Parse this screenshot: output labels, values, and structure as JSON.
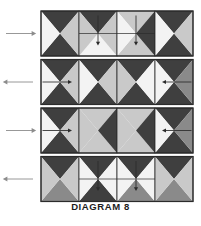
{
  "caption": {
    "text": "DIAGRAM 8"
  },
  "colors": {
    "dark": "#3f3f3f",
    "mid": "#8a8a8a",
    "light": "#c9c9c9",
    "white": "#f3f3f3",
    "outline": "#2b2b2b",
    "arrow": "#2b2b2b",
    "margin_arrow": "#8c8c8c",
    "background": "#ffffff"
  },
  "figure": {
    "label": "folded-paper-strip-diagram",
    "rows_count": 4,
    "cells_per_row": 4,
    "rows": [
      {
        "id": "row-1",
        "margin_arrow": {
          "direction": "right",
          "label": "margin-arrow-right"
        },
        "cells": [
          {
            "id": "r1c1",
            "pattern": "pinwheel-vertical",
            "top": "dark",
            "bottom": "dark",
            "left": "white",
            "right": "light",
            "arrow": "none"
          },
          {
            "id": "r1c2",
            "pattern": "split-horizontal-quad",
            "top": "dark",
            "bottom": "white",
            "left": "light",
            "right": "light",
            "arrow": "down"
          },
          {
            "id": "r1c3",
            "pattern": "split-horizontal-quad",
            "top": "light",
            "bottom": "light",
            "left": "white",
            "right": "dark",
            "arrow": "down"
          },
          {
            "id": "r1c4",
            "pattern": "pinwheel-vertical",
            "top": "dark",
            "bottom": "dark",
            "left": "white",
            "right": "light",
            "arrow": "none"
          }
        ]
      },
      {
        "id": "row-2",
        "margin_arrow": {
          "direction": "left",
          "label": "margin-arrow-left"
        },
        "cells": [
          {
            "id": "r2c1",
            "pattern": "pinwheel-horizontal",
            "top": "dark",
            "bottom": "dark",
            "left": "white",
            "right": "light",
            "arrow": "right"
          },
          {
            "id": "r2c2",
            "pattern": "pinwheel-horizontal",
            "top": "dark",
            "bottom": "dark",
            "left": "white",
            "right": "light",
            "arrow": "none"
          },
          {
            "id": "r2c3",
            "pattern": "pinwheel-horizontal",
            "top": "dark",
            "bottom": "dark",
            "left": "light",
            "right": "white",
            "arrow": "none"
          },
          {
            "id": "r2c4",
            "pattern": "pinwheel-horizontal",
            "top": "dark",
            "bottom": "dark",
            "left": "white",
            "right": "mid",
            "arrow": "left"
          }
        ]
      },
      {
        "id": "row-3",
        "margin_arrow": {
          "direction": "right",
          "label": "margin-arrow-right"
        },
        "cells": [
          {
            "id": "r3c1",
            "pattern": "pinwheel-horizontal",
            "top": "dark",
            "bottom": "dark",
            "left": "white",
            "right": "light",
            "arrow": "right"
          },
          {
            "id": "r3c2",
            "pattern": "pinwheel-horizontal",
            "top": "light",
            "bottom": "light",
            "left": "light",
            "right": "dark",
            "arrow": "none"
          },
          {
            "id": "r3c3",
            "pattern": "pinwheel-horizontal",
            "top": "light",
            "bottom": "light",
            "left": "light",
            "right": "dark",
            "arrow": "none"
          },
          {
            "id": "r3c4",
            "pattern": "pinwheel-horizontal",
            "top": "dark",
            "bottom": "dark",
            "left": "white",
            "right": "mid",
            "arrow": "left"
          }
        ]
      },
      {
        "id": "row-4",
        "margin_arrow": {
          "direction": "left",
          "label": "margin-arrow-left"
        },
        "cells": [
          {
            "id": "r4c1",
            "pattern": "pinwheel-vertical",
            "top": "dark",
            "bottom": "mid",
            "left": "light",
            "right": "light",
            "arrow": "none"
          },
          {
            "id": "r4c2",
            "pattern": "split-horizontal-quad",
            "top": "dark",
            "bottom": "dark",
            "left": "white",
            "right": "white",
            "arrow": "down"
          },
          {
            "id": "r4c3",
            "pattern": "split-horizontal-quad",
            "top": "dark",
            "bottom": "mid",
            "left": "white",
            "right": "white",
            "arrow": "down"
          },
          {
            "id": "r4c4",
            "pattern": "pinwheel-vertical",
            "top": "dark",
            "bottom": "mid",
            "left": "light",
            "right": "light",
            "arrow": "none"
          }
        ]
      }
    ]
  }
}
